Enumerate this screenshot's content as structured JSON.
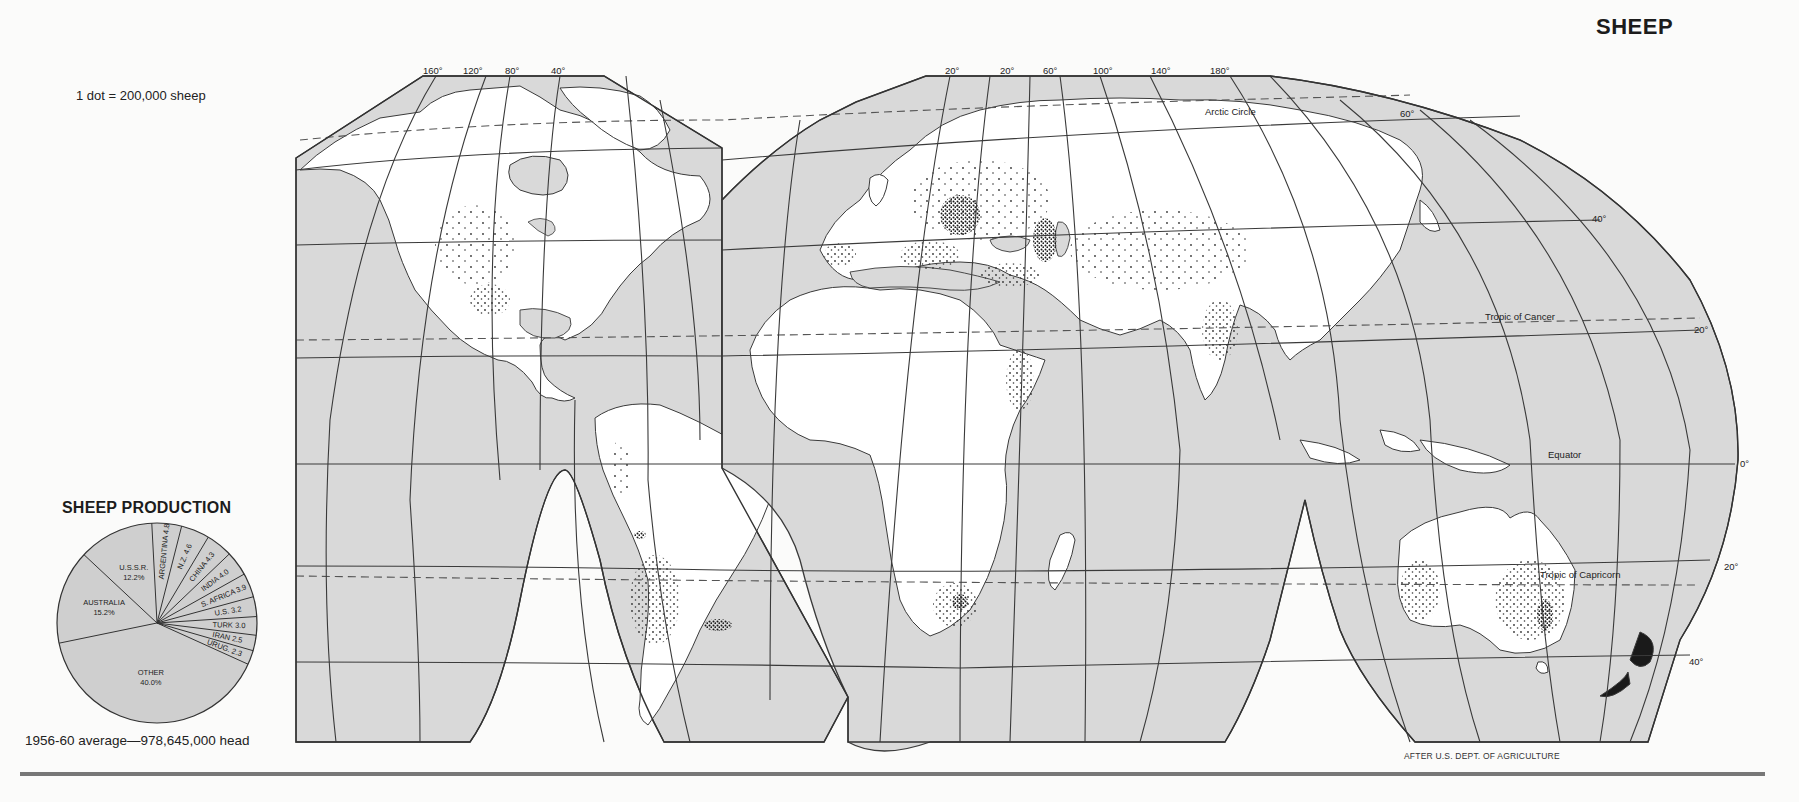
{
  "page": {
    "title": "SHEEP",
    "scale_note": "1 dot = 200,000 sheep",
    "credit": "AFTER U.S. DEPT. OF AGRICULTURE"
  },
  "map": {
    "projection": "interrupted (Goode-style) world map",
    "ocean_color": "#d9d9d9",
    "land_color": "#ffffff",
    "line_color": "#3a3a3a",
    "top_longitude_labels_west": [
      "160°",
      "120°",
      "80°",
      "40°"
    ],
    "top_longitude_labels_east": [
      "20°",
      "20°",
      "60°",
      "100°",
      "140°",
      "180°"
    ],
    "right_latitude_labels": [
      "60°",
      "40°",
      "20°",
      "0°",
      "20°",
      "40°"
    ],
    "lines": {
      "arctic_circle": "Arctic Circle",
      "tropic_of_cancer": "Tropic of Cancer",
      "equator": "Equator",
      "tropic_of_capricorn": "Tropic of Capricorn"
    },
    "dense_areas": [
      "Great Britain",
      "Spain",
      "Balkans",
      "Ukraine",
      "Caucasus",
      "Turkey",
      "India",
      "Uruguay",
      "South Africa",
      "Southeast Australia",
      "New Zealand",
      "Andes"
    ]
  },
  "chart_data": {
    "type": "pie",
    "title": "SHEEP PRODUCTION",
    "caption": "1956-60 average—978,645,000 head",
    "unit": "%",
    "categories": [
      "OTHER",
      "AUSTRALIA",
      "U.S.S.R.",
      "ARGENTINA",
      "N.Z.",
      "CHINA",
      "INDIA",
      "S. AFRICA",
      "U.S.",
      "TURK",
      "IRAN",
      "URUG"
    ],
    "values": [
      40.0,
      15.2,
      12.2,
      4.8,
      4.6,
      4.3,
      4.0,
      3.9,
      3.2,
      3.0,
      2.5,
      2.3
    ],
    "labels": [
      "OTHER 40.0%",
      "AUSTRALIA 15.2%",
      "U.S.S.R. 12.2%",
      "ARGENTINA 4.8",
      "N.Z. 4.6",
      "CHINA 4.3",
      "INDIA 4.0",
      "S. AFRICA 3.9",
      "U.S. 3.2",
      "TURK 3.0",
      "IRAN 2.5",
      "URUG. 2.3"
    ],
    "fill_color": "#cfcfcf",
    "legend": "none (labels inside slices)"
  }
}
